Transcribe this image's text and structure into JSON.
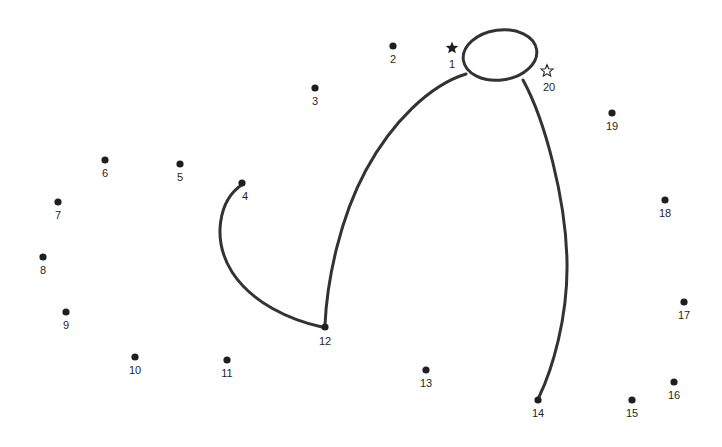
{
  "page": {
    "background_color": "#ffffff",
    "ink_color": "#1f1f1f",
    "stroke_color": "#333333",
    "width": 722,
    "height": 447
  },
  "dots": [
    {
      "label": "1",
      "x": 452,
      "y": 48,
      "marker": "star-filled",
      "label_x": 452,
      "label_y": 68
    },
    {
      "label": "2",
      "x": 393,
      "y": 46,
      "marker": "dot",
      "label_x": 393,
      "label_y": 63
    },
    {
      "label": "3",
      "x": 315,
      "y": 88,
      "marker": "dot",
      "label_x": 315,
      "label_y": 105
    },
    {
      "label": "4",
      "x": 242,
      "y": 183,
      "marker": "dot",
      "label_x": 245,
      "label_y": 200
    },
    {
      "label": "5",
      "x": 180,
      "y": 164,
      "marker": "dot",
      "label_x": 180,
      "label_y": 181
    },
    {
      "label": "6",
      "x": 105,
      "y": 160,
      "marker": "dot",
      "label_x": 105,
      "label_y": 177
    },
    {
      "label": "7",
      "x": 58,
      "y": 202,
      "marker": "dot",
      "label_x": 58,
      "label_y": 219
    },
    {
      "label": "8",
      "x": 43,
      "y": 257,
      "marker": "dot",
      "label_x": 43,
      "label_y": 274
    },
    {
      "label": "9",
      "x": 66,
      "y": 312,
      "marker": "dot",
      "label_x": 66,
      "label_y": 329
    },
    {
      "label": "10",
      "x": 135,
      "y": 357,
      "marker": "dot",
      "label_x": 135,
      "label_y": 374
    },
    {
      "label": "11",
      "x": 227,
      "y": 360,
      "marker": "dot",
      "label_x": 227,
      "label_y": 377
    },
    {
      "label": "12",
      "x": 325,
      "y": 327,
      "marker": "dot",
      "label_x": 325,
      "label_y": 345
    },
    {
      "label": "13",
      "x": 426,
      "y": 370,
      "marker": "dot",
      "label_x": 426,
      "label_y": 387
    },
    {
      "label": "14",
      "x": 538,
      "y": 400,
      "marker": "dot",
      "label_x": 538,
      "label_y": 417
    },
    {
      "label": "15",
      "x": 632,
      "y": 400,
      "marker": "dot",
      "label_x": 632,
      "label_y": 417
    },
    {
      "label": "16",
      "x": 674,
      "y": 382,
      "marker": "dot",
      "label_x": 674,
      "label_y": 399
    },
    {
      "label": "17",
      "x": 684,
      "y": 302,
      "marker": "dot",
      "label_x": 684,
      "label_y": 319
    },
    {
      "label": "18",
      "x": 665,
      "y": 200,
      "marker": "dot",
      "label_x": 665,
      "label_y": 217
    },
    {
      "label": "19",
      "x": 612,
      "y": 113,
      "marker": "dot",
      "label_x": 612,
      "label_y": 130
    },
    {
      "label": "20",
      "x": 547,
      "y": 71,
      "marker": "star-hollow",
      "label_x": 549,
      "label_y": 91
    }
  ],
  "drawn_shapes": {
    "head_ellipse": {
      "name": "head-oval",
      "cx": 500,
      "cy": 55,
      "rx": 37,
      "ry": 25,
      "rotation": -8
    },
    "curves": [
      {
        "name": "curve-4-to-12",
        "from": "4",
        "to": "12",
        "path": "M 243 184 C 218 200 212 240 232 272 C 252 303 290 320 322 327"
      },
      {
        "name": "curve-head-to-12",
        "from": "1",
        "to": "12",
        "path": "M 466 74 C 430 85 392 122 366 170 C 340 218 327 280 325 325"
      },
      {
        "name": "curve-head-to-14",
        "from": "20",
        "to": "14",
        "path": "M 523 80 C 545 120 566 200 567 262 C 568 318 552 370 539 397"
      }
    ]
  }
}
